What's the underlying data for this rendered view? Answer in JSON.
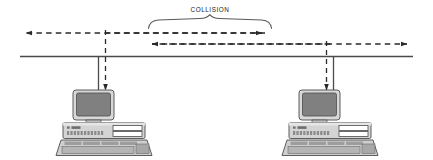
{
  "diagram": {
    "annotation_label": "COLLISION",
    "colors": {
      "line": "#3a3a3a",
      "bus": "#4a4a4a",
      "brace": "#555555",
      "screen": "#808080",
      "case_light": "#d8d8d8",
      "case_mid": "#bdbdbd",
      "case_dark": "#9a9a9a",
      "outline": "#4d4d4d",
      "background": "#ffffff",
      "text": "#1a1a1a"
    },
    "bus": {
      "label": "shared-coaxial-bus",
      "x_start": 20,
      "x_end": 413,
      "y": 56
    },
    "brace": {
      "label": "collision-region-brace",
      "x_start": 148,
      "x_end": 272,
      "y": 24,
      "peak_x": 210
    },
    "signals": [
      {
        "name": "signal-left-propagating",
        "y": 33,
        "x_start": 265,
        "x_end": 22,
        "direction": "left",
        "style": "dashed"
      },
      {
        "name": "signal-right-propagating",
        "y": 33,
        "x_start": 105,
        "x_end": 267,
        "direction": "right",
        "style": "dashed"
      },
      {
        "name": "signal-lower-left-propagating",
        "y": 44,
        "x_start": 330,
        "x_end": 148,
        "direction": "left",
        "style": "dashed"
      },
      {
        "name": "signal-lower-right-propagating",
        "y": 44,
        "x_start": 148,
        "x_end": 411,
        "direction": "right",
        "style": "dashed"
      }
    ],
    "stations": [
      {
        "name": "station-left",
        "tap_x": 98,
        "drop_x": 105,
        "center_x": 104,
        "top_y": 95,
        "arrow_label": "incoming-frame-arrow",
        "arrow_direction": "down"
      },
      {
        "name": "station-right",
        "tap_x": 333,
        "drop_x": 326,
        "center_x": 330,
        "top_y": 95,
        "arrow_label": "incoming-frame-arrow",
        "arrow_direction": "down"
      }
    ]
  }
}
